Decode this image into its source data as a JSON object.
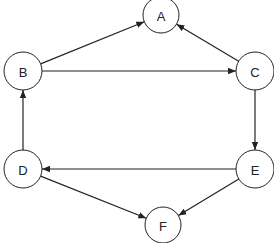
{
  "diagram": {
    "type": "directed-graph",
    "nodes": [
      {
        "id": "A",
        "label": "A",
        "x": 161,
        "y": 15,
        "r": 18
      },
      {
        "id": "B",
        "label": "B",
        "x": 23,
        "y": 71,
        "r": 19
      },
      {
        "id": "C",
        "label": "C",
        "x": 255,
        "y": 71,
        "r": 19
      },
      {
        "id": "D",
        "label": "D",
        "x": 23,
        "y": 169,
        "r": 19
      },
      {
        "id": "E",
        "label": "E",
        "x": 255,
        "y": 169,
        "r": 19
      },
      {
        "id": "F",
        "label": "F",
        "x": 163,
        "y": 225,
        "r": 18
      }
    ],
    "edges": [
      {
        "from": "B",
        "to": "A"
      },
      {
        "from": "C",
        "to": "A"
      },
      {
        "from": "B",
        "to": "C"
      },
      {
        "from": "C",
        "to": "E"
      },
      {
        "from": "E",
        "to": "D"
      },
      {
        "from": "D",
        "to": "B"
      },
      {
        "from": "D",
        "to": "F"
      },
      {
        "from": "E",
        "to": "F"
      }
    ],
    "colors": {
      "stroke": "#222222",
      "fill": "#ffffff",
      "background": "#ffffff"
    }
  }
}
